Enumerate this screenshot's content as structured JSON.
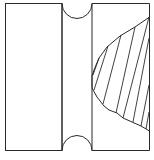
{
  "diagram": {
    "title": "",
    "colors": {
      "background": "#ffffff",
      "stroke": "#2b2b2b"
    },
    "frame": {
      "x": 5,
      "y": 3,
      "width": 144,
      "height": 148
    },
    "blocks": [
      {
        "id": "left-block",
        "label": "",
        "x": 5,
        "y": 3,
        "width": 57,
        "height": 148
      },
      {
        "id": "middle-strip",
        "label": "",
        "x": 62,
        "y": 3,
        "width": 30,
        "height": 148,
        "notches": [
          "top-semicircle",
          "bottom-semicircle"
        ]
      },
      {
        "id": "right-block",
        "label": "",
        "x": 92,
        "y": 3,
        "width": 57,
        "height": 148,
        "hatched_region": true
      }
    ],
    "hatched_region": {
      "boundary": [
        [
          149,
          17
        ],
        [
          135,
          27
        ],
        [
          120,
          37
        ],
        [
          107,
          50
        ],
        [
          98,
          62
        ],
        [
          93,
          72
        ],
        [
          92,
          88
        ],
        [
          98,
          98
        ],
        [
          107,
          110
        ],
        [
          121,
          118
        ],
        [
          135,
          125
        ],
        [
          149,
          131
        ]
      ],
      "hatch_line_count": 8
    }
  }
}
